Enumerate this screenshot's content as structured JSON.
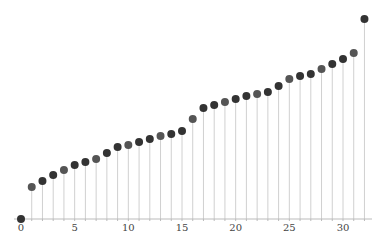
{
  "chart_data": {
    "type": "stem",
    "title": "",
    "xlabel": "",
    "ylabel": "",
    "x": [
      0,
      1,
      2,
      3,
      4,
      5,
      6,
      7,
      8,
      9,
      10,
      11,
      12,
      13,
      14,
      15,
      16,
      17,
      18,
      19,
      20,
      21,
      22,
      23,
      24,
      25,
      26,
      27,
      28,
      29,
      30,
      31,
      32
    ],
    "values": [
      0,
      0.16,
      0.19,
      0.22,
      0.245,
      0.27,
      0.285,
      0.3,
      0.33,
      0.36,
      0.37,
      0.385,
      0.4,
      0.415,
      0.425,
      0.44,
      0.5,
      0.555,
      0.57,
      0.585,
      0.6,
      0.615,
      0.625,
      0.635,
      0.665,
      0.7,
      0.715,
      0.725,
      0.75,
      0.775,
      0.8,
      0.83,
      1.0
    ],
    "xticks": [
      0,
      5,
      10,
      15,
      20,
      25,
      30
    ],
    "xlim": [
      -1,
      33
    ],
    "ylim": [
      0,
      1.0
    ],
    "grid": false,
    "legend": null,
    "colors": {
      "marker": "#333333",
      "marker_alt": "#555555",
      "stem": "#d0d0d0",
      "axis": "#bbbbbb",
      "tick_text": "#444444"
    }
  }
}
